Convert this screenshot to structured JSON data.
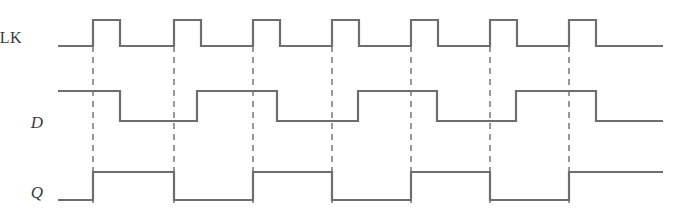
{
  "figure": {
    "kind": "digital-timing-diagram",
    "width": 677,
    "height": 209,
    "background_color": "#ffffff",
    "trace_color": "#6e6e6e",
    "dashed_color": "#6e6e6e",
    "label_color": "#3a3a3a",
    "trace_width": 2.2,
    "dashed_width": 1.4,
    "dash_pattern": "6,5"
  },
  "signals": [
    {
      "name": "CLK",
      "label": "CLK",
      "label_style": "roman",
      "label_x": 22,
      "label_y": 38,
      "high_y": 20,
      "low_y": 46,
      "start_level": 0,
      "transitions": [
        93,
        120,
        174,
        201,
        253,
        280,
        332,
        359,
        411,
        438,
        490,
        517,
        569,
        596
      ],
      "x_start": 58,
      "x_end": 663
    },
    {
      "name": "D",
      "label": "D",
      "label_style": "italic",
      "label_x": 43,
      "label_y": 122,
      "high_y": 91,
      "low_y": 121,
      "start_level": 1,
      "transitions": [
        120,
        197,
        277,
        358,
        437,
        516,
        596
      ],
      "x_start": 58,
      "x_end": 663
    },
    {
      "name": "Q",
      "label": "Q",
      "label_style": "italic",
      "label_x": 43,
      "label_y": 192,
      "high_y": 172,
      "low_y": 200,
      "start_level": 0,
      "transitions": [
        93,
        174,
        253,
        332,
        411,
        490,
        569
      ],
      "x_start": 58,
      "x_end": 663
    }
  ],
  "clock_edges": {
    "description": "dashed vertical guide lines at each CLK rising edge",
    "x_positions": [
      93,
      174,
      253,
      332,
      411,
      490,
      569
    ],
    "y_top": 46,
    "y_bottom": 203
  },
  "axis": {
    "x_label": "",
    "y_label": "",
    "ticks": [],
    "grid": false
  },
  "chart_data": {
    "type": "line",
    "title": "",
    "xlabel": "",
    "ylabel": "",
    "grid": false,
    "legend": "none",
    "x": [
      93,
      174,
      253,
      332,
      411,
      490,
      569
    ],
    "series": [
      {
        "name": "CLK",
        "values": [
          1,
          1,
          1,
          1,
          1,
          1,
          1
        ]
      },
      {
        "name": "D",
        "values": [
          1,
          0,
          1,
          0,
          1,
          0,
          1
        ]
      },
      {
        "name": "Q",
        "values": [
          1,
          0,
          1,
          0,
          1,
          0,
          1
        ]
      }
    ]
  }
}
